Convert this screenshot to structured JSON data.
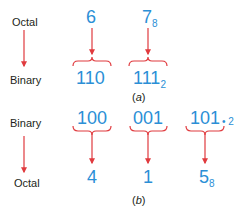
{
  "colors": {
    "digit_blue": "#2b8fd6",
    "arrow_red": "#e03a3e",
    "label_dark": "#231f20"
  },
  "part_a": {
    "row_labels": {
      "top": "Octal",
      "bottom": "Binary"
    },
    "groups": [
      {
        "top": "6",
        "top_sub": "",
        "bottom": "110",
        "bottom_sub": ""
      },
      {
        "top": "7",
        "top_sub": "8",
        "bottom": "111",
        "bottom_sub": "2"
      }
    ],
    "caption_open": "(",
    "caption_letter": "a",
    "caption_close": ")"
  },
  "part_b": {
    "row_labels": {
      "top": "Binary",
      "bottom": "Octal"
    },
    "groups": [
      {
        "top": "100",
        "bottom": "4",
        "bottom_sub": ""
      },
      {
        "top": "001",
        "bottom": "1",
        "bottom_sub": ""
      },
      {
        "top": "101",
        "bottom": "5",
        "bottom_sub": "8"
      }
    ],
    "radix_note": "• 2",
    "caption_open": "(",
    "caption_letter": "b",
    "caption_close": ")"
  }
}
